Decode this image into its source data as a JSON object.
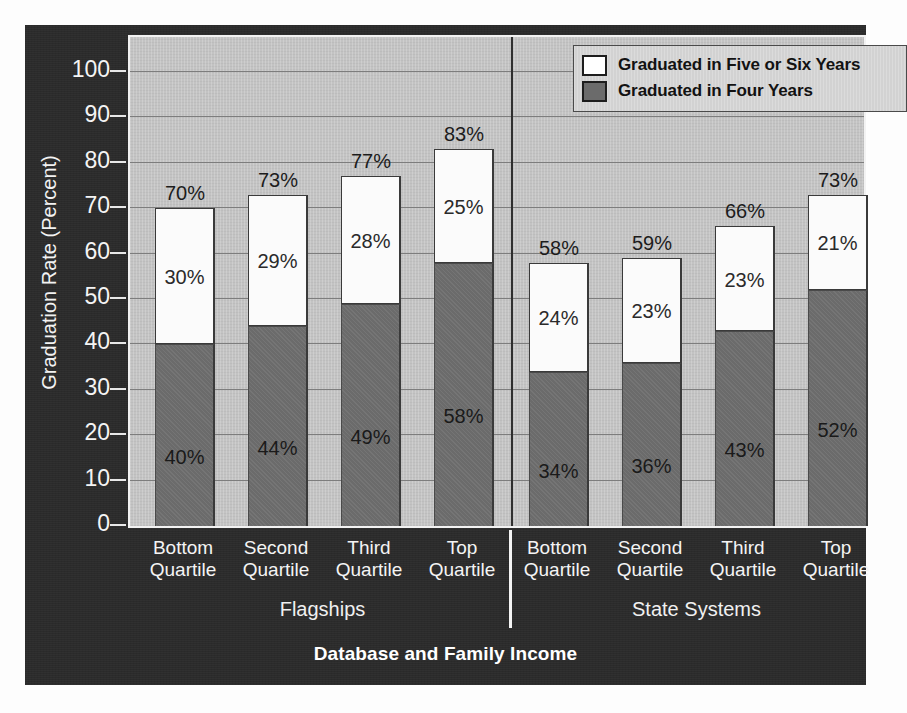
{
  "chart_data": {
    "type": "bar",
    "subtype": "stacked-grouped",
    "title": "",
    "xlabel": "Database and Family Income",
    "ylabel": "Graduation Rate (Percent)",
    "ylim": [
      0,
      100
    ],
    "ytick_step": 10,
    "yticks": [
      "100",
      "90",
      "80",
      "70",
      "60",
      "50",
      "40",
      "30",
      "20",
      "10",
      "0"
    ],
    "grid": "horizontal",
    "legend_position": "top-right",
    "legend": [
      {
        "label": "Graduated in Five or Six Years",
        "swatch": "white"
      },
      {
        "label": "Graduated in Four Years",
        "swatch": "gray"
      }
    ],
    "series": [
      {
        "name": "Graduated in Four Years",
        "values": [
          40,
          44,
          49,
          58,
          34,
          36,
          43,
          52
        ]
      },
      {
        "name": "Graduated in Five or Six Years",
        "values": [
          30,
          29,
          28,
          25,
          24,
          23,
          23,
          21
        ]
      }
    ],
    "totals": [
      70,
      73,
      77,
      83,
      58,
      59,
      66,
      73
    ],
    "categories": [
      "Bottom\nQuartile",
      "Second\nQuartile",
      "Third\nQuartile",
      "Top\nQuartile",
      "Bottom\nQuartile",
      "Second\nQuartile",
      "Third\nQuartile",
      "Top\nQuartile"
    ],
    "groups": [
      {
        "label": "Flagships",
        "categories": [
          "Bottom Quartile",
          "Second Quartile",
          "Third Quartile",
          "Top Quartile"
        ]
      },
      {
        "label": "State Systems",
        "categories": [
          "Bottom Quartile",
          "Second Quartile",
          "Third Quartile",
          "Top Quartile"
        ]
      }
    ],
    "colors": {
      "four_years": "#6b6b6b",
      "five_or_six_years": "#fbfbfb",
      "plot_background": "#c3c3c3",
      "figure_background": "#2b2b2b",
      "gridline": "#7d7d7d",
      "axis_text": "#f4f4f4"
    }
  },
  "bars": [
    {
      "cat_line1": "Bottom",
      "cat_line2": "Quartile",
      "four": "40%",
      "five": "30%",
      "total": "70%"
    },
    {
      "cat_line1": "Second",
      "cat_line2": "Quartile",
      "four": "44%",
      "five": "29%",
      "total": "73%"
    },
    {
      "cat_line1": "Third",
      "cat_line2": "Quartile",
      "four": "49%",
      "five": "28%",
      "total": "77%"
    },
    {
      "cat_line1": "Top",
      "cat_line2": "Quartile",
      "four": "58%",
      "five": "25%",
      "total": "83%"
    },
    {
      "cat_line1": "Bottom",
      "cat_line2": "Quartile",
      "four": "34%",
      "five": "24%",
      "total": "58%"
    },
    {
      "cat_line1": "Second",
      "cat_line2": "Quartile",
      "four": "36%",
      "five": "23%",
      "total": "59%"
    },
    {
      "cat_line1": "Third",
      "cat_line2": "Quartile",
      "four": "43%",
      "five": "23%",
      "total": "66%"
    },
    {
      "cat_line1": "Top",
      "cat_line2": "Quartile",
      "four": "52%",
      "five": "21%",
      "total": "73%"
    }
  ],
  "axis": {
    "y_label": "Graduation Rate (Percent)",
    "x_title": "Database and Family Income",
    "ticks": [
      "100",
      "90",
      "80",
      "70",
      "60",
      "50",
      "40",
      "30",
      "20",
      "10",
      "0"
    ]
  },
  "groups": [
    {
      "label": "Flagships"
    },
    {
      "label": "State Systems"
    }
  ],
  "legend": {
    "items": [
      {
        "label": "Graduated in Five or Six Years"
      },
      {
        "label": "Graduated in Four Years"
      }
    ]
  }
}
